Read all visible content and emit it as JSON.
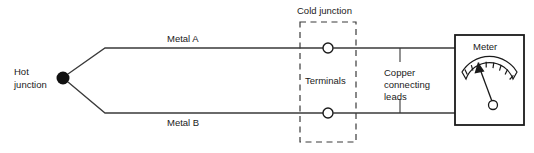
{
  "diagram": {
    "labels": {
      "hot_junction_line1": "Hot",
      "hot_junction_line2": "junction",
      "metal_a": "Metal A",
      "metal_b": "Metal B",
      "cold_junction": "Cold junction",
      "terminals": "Terminals",
      "copper_leads_line1": "Copper",
      "copper_leads_line2": "connecting",
      "copper_leads_line3": "leads",
      "meter": "Meter"
    },
    "colors": {
      "background": "#ffffff",
      "line": "#3a3a3a",
      "ink": "#1a1a1a",
      "junction_dot": "#111111"
    },
    "meter": {
      "scale_tick_count": 8,
      "needle_reading_fraction": 0.22
    }
  }
}
